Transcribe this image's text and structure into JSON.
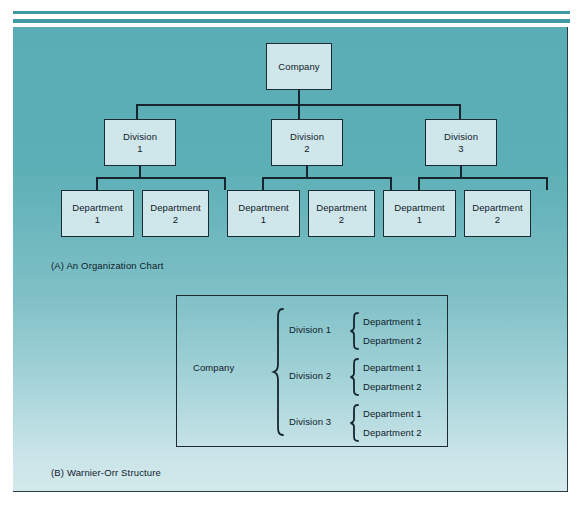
{
  "figure": {
    "org_chart": {
      "caption": "(A) An Organization Chart",
      "root": "Company",
      "divisions": [
        {
          "line1": "Division",
          "line2": "1"
        },
        {
          "line1": "Division",
          "line2": "2"
        },
        {
          "line1": "Division",
          "line2": "3"
        }
      ],
      "departments": [
        {
          "line1": "Department",
          "line2": "1"
        },
        {
          "line1": "Department",
          "line2": "2"
        },
        {
          "line1": "Department",
          "line2": "1"
        },
        {
          "line1": "Department",
          "line2": "2"
        },
        {
          "line1": "Department",
          "line2": "1"
        },
        {
          "line1": "Department",
          "line2": "2"
        }
      ]
    },
    "warnier_orr": {
      "caption": "(B) Warnier-Orr Structure",
      "root": "Company",
      "groups": [
        {
          "division": "Division 1",
          "departments": [
            "Department 1",
            "Department 2"
          ]
        },
        {
          "division": "Division 2",
          "departments": [
            "Department 1",
            "Department 2"
          ]
        },
        {
          "division": "Division 3",
          "departments": [
            "Department 1",
            "Department 2"
          ]
        }
      ]
    }
  },
  "colors": {
    "panel_top": "#5aadb5",
    "panel_bottom": "#d4e9ec",
    "box_fill": "#cfe6ea",
    "stroke": "#16252e",
    "rule": "#3f9aa6",
    "text": "#10202a"
  }
}
